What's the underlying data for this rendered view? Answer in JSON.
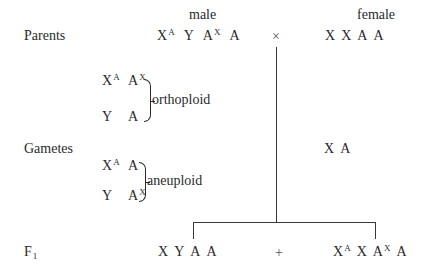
{
  "headers": {
    "male": "male",
    "female": "female"
  },
  "rows": {
    "parents_label": "Parents",
    "gametes_label": "Gametes",
    "f1_label": "F",
    "f1_sub": "1"
  },
  "parents": {
    "male": [
      {
        "base": "X",
        "sup": "A"
      },
      {
        "base": "Y",
        "sup": ""
      },
      {
        "base": "A",
        "sup": "X"
      },
      {
        "base": "A",
        "sup": ""
      }
    ],
    "cross_symbol": "×",
    "female": [
      "X",
      "X",
      "A",
      "A"
    ]
  },
  "gametes": {
    "orthoploid": {
      "label": "orthoploid",
      "row1": [
        {
          "base": "X",
          "sup": "A"
        },
        {
          "base": "A",
          "sup": "X"
        }
      ],
      "row2": [
        {
          "base": "Y",
          "sup": ""
        },
        {
          "base": "A",
          "sup": ""
        }
      ]
    },
    "aneuploid": {
      "label": "aneuploid",
      "row1": [
        {
          "base": "X",
          "sup": "A"
        },
        {
          "base": "A",
          "sup": ""
        }
      ],
      "row2": [
        {
          "base": "Y",
          "sup": ""
        },
        {
          "base": "A",
          "sup": "X"
        }
      ]
    },
    "female": [
      "X",
      "A"
    ]
  },
  "f1": {
    "left": [
      {
        "base": "X",
        "sup": ""
      },
      {
        "base": "Y",
        "sup": ""
      },
      {
        "base": "A",
        "sup": ""
      },
      {
        "base": "A",
        "sup": ""
      }
    ],
    "plus_symbol": "+",
    "right": [
      {
        "base": "X",
        "sup": "A"
      },
      {
        "base": "X",
        "sup": ""
      },
      {
        "base": "A",
        "sup": "X"
      },
      {
        "base": "A",
        "sup": ""
      }
    ]
  }
}
